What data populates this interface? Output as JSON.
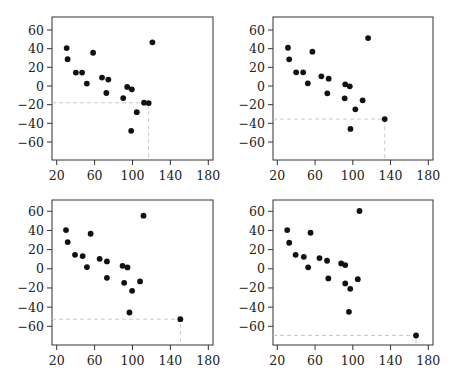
{
  "chart_data": [
    {
      "type": "scatter",
      "panel": "top-left",
      "title": "",
      "xlabel": "",
      "ylabel": "",
      "xlim": [
        15,
        185
      ],
      "ylim": [
        -77,
        77
      ],
      "xticks": [
        20,
        60,
        100,
        140,
        180
      ],
      "yticks": [
        60,
        40,
        20,
        0,
        -20,
        -40,
        -60
      ],
      "ytick_labels": [
        "60",
        "40",
        "20",
        "0",
        "−20",
        "−40",
        "−60"
      ],
      "grid": false,
      "highlight": {
        "x": 117,
        "y": -18
      },
      "points": [
        {
          "x": 30.5,
          "y": 40.6
        },
        {
          "x": 31.5,
          "y": 28.7
        },
        {
          "x": 58.4,
          "y": 35.6
        },
        {
          "x": 40.2,
          "y": 14.4
        },
        {
          "x": 46.8,
          "y": 14.4
        },
        {
          "x": 51.8,
          "y": 2.6
        },
        {
          "x": 67.8,
          "y": 9.0
        },
        {
          "x": 74.5,
          "y": 6.9
        },
        {
          "x": 72.4,
          "y": -7.5
        },
        {
          "x": 94.4,
          "y": -1.0
        },
        {
          "x": 99.3,
          "y": -3.6
        },
        {
          "x": 90.2,
          "y": -12.9
        },
        {
          "x": 112.2,
          "y": -17.9
        },
        {
          "x": 117.1,
          "y": -18.3
        },
        {
          "x": 104.5,
          "y": -28.0
        },
        {
          "x": 98.6,
          "y": -48.0
        },
        {
          "x": 121.0,
          "y": 46.8
        }
      ]
    },
    {
      "type": "scatter",
      "panel": "top-right",
      "title": "",
      "xlabel": "",
      "ylabel": "",
      "xlim": [
        15,
        185
      ],
      "ylim": [
        -77,
        77
      ],
      "xticks": [
        20,
        60,
        100,
        140,
        180
      ],
      "yticks": [
        60,
        40,
        20,
        0,
        -20,
        -40,
        -60
      ],
      "ytick_labels": [
        "60",
        "40",
        "20",
        "0",
        "−20",
        "−40",
        "−60"
      ],
      "grid": false,
      "highlight": {
        "x": 133.8,
        "y": -35.4
      },
      "points": [
        {
          "x": 31.3,
          "y": 41.0
        },
        {
          "x": 32.6,
          "y": 28.6
        },
        {
          "x": 57.2,
          "y": 36.8
        },
        {
          "x": 40.0,
          "y": 14.7
        },
        {
          "x": 47.4,
          "y": 14.7
        },
        {
          "x": 52.3,
          "y": 2.9
        },
        {
          "x": 66.7,
          "y": 10.4
        },
        {
          "x": 74.4,
          "y": 7.9
        },
        {
          "x": 73.0,
          "y": -7.9
        },
        {
          "x": 92.0,
          "y": 1.8
        },
        {
          "x": 96.8,
          "y": -0.4
        },
        {
          "x": 91.4,
          "y": -13.2
        },
        {
          "x": 110.4,
          "y": -15.3
        },
        {
          "x": 102.7,
          "y": -25.0
        },
        {
          "x": 116.2,
          "y": 51.4
        },
        {
          "x": 133.8,
          "y": -35.4
        },
        {
          "x": 97.5,
          "y": -46.0
        }
      ]
    },
    {
      "type": "scatter",
      "panel": "bottom-left",
      "title": "",
      "xlabel": "",
      "ylabel": "",
      "xlim": [
        15,
        185
      ],
      "ylim": [
        -80,
        72
      ],
      "xticks": [
        20,
        60,
        100,
        140,
        180
      ],
      "yticks": [
        60,
        40,
        20,
        0,
        -20,
        -40,
        -60
      ],
      "ytick_labels": [
        "60",
        "40",
        "20",
        "0",
        "−20",
        "−40",
        "−60"
      ],
      "grid": false,
      "highlight": {
        "x": 150.5,
        "y": -52.6
      },
      "points": [
        {
          "x": 29.8,
          "y": 40.4
        },
        {
          "x": 31.6,
          "y": 27.9
        },
        {
          "x": 55.8,
          "y": 36.6
        },
        {
          "x": 39.3,
          "y": 14.6
        },
        {
          "x": 47.4,
          "y": 13.3
        },
        {
          "x": 51.9,
          "y": 1.8
        },
        {
          "x": 65.3,
          "y": 10.4
        },
        {
          "x": 73.0,
          "y": 7.7
        },
        {
          "x": 73.0,
          "y": -9.4
        },
        {
          "x": 89.5,
          "y": 3.1
        },
        {
          "x": 94.7,
          "y": 1.4
        },
        {
          "x": 91.2,
          "y": -14.6
        },
        {
          "x": 108.0,
          "y": -13.2
        },
        {
          "x": 99.6,
          "y": -23.0
        },
        {
          "x": 111.6,
          "y": 55.4
        },
        {
          "x": 96.8,
          "y": -45.6
        },
        {
          "x": 150.5,
          "y": -52.6
        }
      ]
    },
    {
      "type": "scatter",
      "panel": "bottom-right",
      "title": "",
      "xlabel": "",
      "ylabel": "",
      "xlim": [
        15,
        185
      ],
      "ylim": [
        -80,
        72
      ],
      "xticks": [
        20,
        60,
        100,
        140,
        180
      ],
      "yticks": [
        60,
        40,
        20,
        0,
        -20,
        -40,
        -60
      ],
      "ytick_labels": [
        "60",
        "40",
        "20",
        "0",
        "−20",
        "−40",
        "−60"
      ],
      "grid": false,
      "highlight": {
        "x": 167.0,
        "y": -69.6
      },
      "points": [
        {
          "x": 30.5,
          "y": 40.4
        },
        {
          "x": 32.6,
          "y": 27.2
        },
        {
          "x": 55.2,
          "y": 37.6
        },
        {
          "x": 39.4,
          "y": 14.6
        },
        {
          "x": 48.1,
          "y": 12.5
        },
        {
          "x": 52.7,
          "y": 1.5
        },
        {
          "x": 64.7,
          "y": 11.2
        },
        {
          "x": 72.7,
          "y": 8.4
        },
        {
          "x": 74.1,
          "y": -10.0
        },
        {
          "x": 87.7,
          "y": 5.6
        },
        {
          "x": 92.0,
          "y": 3.9
        },
        {
          "x": 92.0,
          "y": -15.3
        },
        {
          "x": 105.3,
          "y": -10.8
        },
        {
          "x": 97.3,
          "y": -20.9
        },
        {
          "x": 107.1,
          "y": 60.3
        },
        {
          "x": 95.9,
          "y": -44.9
        },
        {
          "x": 167.0,
          "y": -69.6
        }
      ]
    }
  ],
  "style": {
    "point_color": "#111111",
    "frame_color": "#333333",
    "guide_color": "#c8c8c8"
  }
}
